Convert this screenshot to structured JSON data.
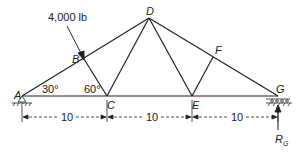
{
  "load": {
    "label": "4,000 lb"
  },
  "nodes": {
    "A": "A",
    "B": "B",
    "C": "C",
    "D": "D",
    "E": "E",
    "F": "F",
    "G": "G"
  },
  "angles": {
    "at_A": "30°",
    "at_C": "60°"
  },
  "dimensions": [
    "10",
    "10",
    "10"
  ],
  "reaction": {
    "label": "R",
    "sub": "G"
  },
  "colors": {
    "ink": "#222222"
  }
}
